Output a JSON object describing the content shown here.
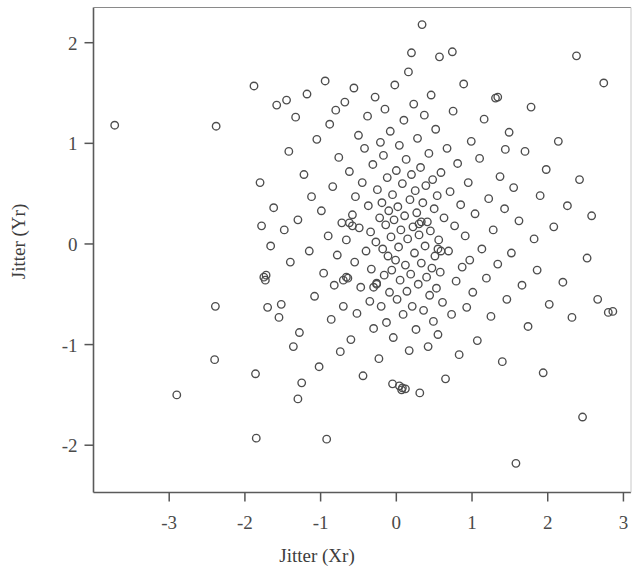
{
  "chart_data": {
    "type": "scatter",
    "title": "",
    "xlabel": "Jitter (Xr)",
    "ylabel": "Jitter (Yr)",
    "xlim": [
      -4.0,
      3.1
    ],
    "ylim": [
      -2.47,
      2.35
    ],
    "xticks": [
      -3,
      -2,
      -1,
      0,
      1,
      2,
      3
    ],
    "xtick_labels": [
      "-3",
      "-2",
      "-1",
      "0",
      "1",
      "2",
      "3"
    ],
    "yticks": [
      -2,
      -1,
      0,
      1,
      2
    ],
    "ytick_labels": [
      "-2",
      "-1",
      "0",
      "1",
      "2"
    ],
    "grid": false,
    "legend": null,
    "marker": "open-circle",
    "marker_size": 7.5,
    "marker_color": "#4d4d4d",
    "n_points": 249,
    "points": [
      [
        -3.72,
        1.18
      ],
      [
        -2.9,
        -1.5
      ],
      [
        -2.38,
        1.17
      ],
      [
        -2.39,
        -0.62
      ],
      [
        -2.4,
        -1.15
      ],
      [
        -1.88,
        1.57
      ],
      [
        -1.86,
        -1.29
      ],
      [
        -1.85,
        -1.93
      ],
      [
        -1.8,
        0.61
      ],
      [
        -1.78,
        0.18
      ],
      [
        -1.75,
        -0.33
      ],
      [
        -1.73,
        -0.36
      ],
      [
        -1.7,
        -0.63
      ],
      [
        -1.66,
        -0.02
      ],
      [
        -1.62,
        0.36
      ],
      [
        -1.58,
        1.38
      ],
      [
        -1.55,
        -0.73
      ],
      [
        -1.52,
        -0.6
      ],
      [
        -1.48,
        0.14
      ],
      [
        -1.45,
        1.43
      ],
      [
        -1.42,
        0.92
      ],
      [
        -1.4,
        -0.18
      ],
      [
        -1.36,
        -1.02
      ],
      [
        -1.33,
        1.26
      ],
      [
        -1.3,
        0.24
      ],
      [
        -1.28,
        -0.88
      ],
      [
        -1.25,
        -1.38
      ],
      [
        -1.22,
        0.69
      ],
      [
        -1.18,
        1.49
      ],
      [
        -1.15,
        -0.07
      ],
      [
        -1.12,
        0.47
      ],
      [
        -1.08,
        -0.52
      ],
      [
        -1.05,
        1.04
      ],
      [
        -1.02,
        -1.22
      ],
      [
        -0.99,
        0.33
      ],
      [
        -0.96,
        -0.29
      ],
      [
        -0.94,
        1.62
      ],
      [
        -0.92,
        -1.94
      ],
      [
        -0.9,
        0.08
      ],
      [
        -0.88,
        1.19
      ],
      [
        -0.86,
        -0.75
      ],
      [
        -0.84,
        0.57
      ],
      [
        -0.82,
        -0.41
      ],
      [
        -0.8,
        1.33
      ],
      [
        -0.78,
        -0.11
      ],
      [
        -0.76,
        0.86
      ],
      [
        -0.74,
        -1.07
      ],
      [
        -0.72,
        0.21
      ],
      [
        -0.7,
        -0.62
      ],
      [
        -0.68,
        1.41
      ],
      [
        -0.66,
        0.04
      ],
      [
        -0.64,
        -0.34
      ],
      [
        -0.62,
        0.72
      ],
      [
        -0.6,
        -0.95
      ],
      [
        -0.58,
        0.29
      ],
      [
        -0.56,
        1.55
      ],
      [
        -0.55,
        -0.18
      ],
      [
        -0.54,
        0.47
      ],
      [
        -0.52,
        -0.69
      ],
      [
        -0.5,
        1.08
      ],
      [
        -0.49,
        0.16
      ],
      [
        -0.47,
        -0.43
      ],
      [
        -0.45,
        0.61
      ],
      [
        -0.44,
        -1.31
      ],
      [
        -0.42,
        0.95
      ],
      [
        -0.4,
        -0.07
      ],
      [
        -0.38,
        1.27
      ],
      [
        -0.37,
        0.38
      ],
      [
        -0.35,
        -0.57
      ],
      [
        -0.34,
        0.12
      ],
      [
        -0.33,
        -0.25
      ],
      [
        -0.31,
        0.79
      ],
      [
        -0.3,
        -0.84
      ],
      [
        -0.28,
        1.46
      ],
      [
        -0.27,
        0.02
      ],
      [
        -0.26,
        -0.39
      ],
      [
        -0.25,
        0.54
      ],
      [
        -0.23,
        -1.14
      ],
      [
        -0.22,
        0.26
      ],
      [
        -0.21,
        1.01
      ],
      [
        -0.2,
        -0.62
      ],
      [
        -0.19,
        0.41
      ],
      [
        -0.18,
        -0.05
      ],
      [
        -0.17,
        0.88
      ],
      [
        -0.16,
        -0.31
      ],
      [
        -0.15,
        1.34
      ],
      [
        -0.14,
        0.19
      ],
      [
        -0.13,
        -0.78
      ],
      [
        -0.12,
        0.66
      ],
      [
        -0.11,
        -0.12
      ],
      [
        -0.1,
        0.33
      ],
      [
        -0.09,
        -0.48
      ],
      [
        -0.08,
        1.12
      ],
      [
        -0.07,
        0.07
      ],
      [
        -0.06,
        -0.26
      ],
      [
        -0.05,
        0.49
      ],
      [
        -0.04,
        -0.93
      ],
      [
        -0.03,
        0.24
      ],
      [
        -0.02,
        1.58
      ],
      [
        -0.01,
        -0.16
      ],
      [
        0.0,
        0.73
      ],
      [
        0.01,
        -0.55
      ],
      [
        0.02,
        0.37
      ],
      [
        0.03,
        -0.03
      ],
      [
        0.04,
        0.98
      ],
      [
        0.05,
        -0.36
      ],
      [
        0.06,
        0.14
      ],
      [
        0.07,
        -1.45
      ],
      [
        0.08,
        0.6
      ],
      [
        0.09,
        -0.7
      ],
      [
        0.1,
        1.23
      ],
      [
        0.11,
        0.28
      ],
      [
        0.12,
        -0.21
      ],
      [
        0.13,
        0.84
      ],
      [
        0.14,
        -0.47
      ],
      [
        0.15,
        0.05
      ],
      [
        0.16,
        1.71
      ],
      [
        0.17,
        -1.06
      ],
      [
        0.18,
        0.44
      ],
      [
        0.19,
        -0.3
      ],
      [
        0.2,
        0.69
      ],
      [
        0.21,
        -0.62
      ],
      [
        0.22,
        0.17
      ],
      [
        0.23,
        1.39
      ],
      [
        0.24,
        -0.09
      ],
      [
        0.25,
        0.53
      ],
      [
        0.26,
        -0.85
      ],
      [
        0.27,
        0.31
      ],
      [
        0.28,
        1.05
      ],
      [
        0.29,
        -0.4
      ],
      [
        0.3,
        0.09
      ],
      [
        0.31,
        -1.48
      ],
      [
        0.32,
        0.76
      ],
      [
        0.33,
        -0.19
      ],
      [
        0.34,
        2.18
      ],
      [
        0.35,
        0.41
      ],
      [
        0.36,
        -0.66
      ],
      [
        0.37,
        1.28
      ],
      [
        0.38,
        -0.02
      ],
      [
        0.39,
        0.58
      ],
      [
        0.4,
        -0.33
      ],
      [
        0.41,
        0.22
      ],
      [
        0.42,
        -1.02
      ],
      [
        0.43,
        0.9
      ],
      [
        0.44,
        -0.51
      ],
      [
        0.45,
        0.13
      ],
      [
        0.46,
        1.48
      ],
      [
        0.47,
        -0.24
      ],
      [
        0.48,
        0.64
      ],
      [
        0.49,
        -0.77
      ],
      [
        0.5,
        0.35
      ],
      [
        0.51,
        -0.12
      ],
      [
        0.52,
        1.14
      ],
      [
        0.53,
        -0.44
      ],
      [
        0.54,
        0.48
      ],
      [
        0.55,
        -0.9
      ],
      [
        0.56,
        0.04
      ],
      [
        0.57,
        1.86
      ],
      [
        0.58,
        -0.28
      ],
      [
        0.59,
        0.71
      ],
      [
        0.61,
        -0.58
      ],
      [
        0.63,
        0.26
      ],
      [
        0.65,
        -1.34
      ],
      [
        0.67,
        0.95
      ],
      [
        0.69,
        -0.07
      ],
      [
        0.71,
        0.52
      ],
      [
        0.73,
        -0.7
      ],
      [
        0.75,
        1.32
      ],
      [
        0.77,
        0.18
      ],
      [
        0.79,
        -0.37
      ],
      [
        0.81,
        0.8
      ],
      [
        0.83,
        -1.1
      ],
      [
        0.85,
        0.39
      ],
      [
        0.87,
        -0.23
      ],
      [
        0.89,
        1.59
      ],
      [
        0.91,
        0.08
      ],
      [
        0.93,
        -0.63
      ],
      [
        0.95,
        0.61
      ],
      [
        0.97,
        -0.16
      ],
      [
        0.99,
        1.02
      ],
      [
        1.01,
        -0.48
      ],
      [
        1.04,
        0.3
      ],
      [
        1.07,
        -0.96
      ],
      [
        1.1,
        0.85
      ],
      [
        1.13,
        -0.05
      ],
      [
        1.16,
        1.24
      ],
      [
        1.19,
        -0.34
      ],
      [
        1.22,
        0.45
      ],
      [
        1.25,
        -0.72
      ],
      [
        1.28,
        0.14
      ],
      [
        1.31,
        1.45
      ],
      [
        1.34,
        -0.2
      ],
      [
        1.37,
        0.67
      ],
      [
        1.4,
        -1.17
      ],
      [
        1.43,
        0.35
      ],
      [
        1.46,
        -0.55
      ],
      [
        1.49,
        1.11
      ],
      [
        1.52,
        -0.09
      ],
      [
        1.55,
        0.56
      ],
      [
        1.58,
        -2.18
      ],
      [
        1.62,
        0.23
      ],
      [
        1.66,
        -0.41
      ],
      [
        1.7,
        0.92
      ],
      [
        1.74,
        -0.82
      ],
      [
        1.78,
        1.36
      ],
      [
        1.82,
        0.05
      ],
      [
        1.86,
        -0.26
      ],
      [
        1.9,
        0.48
      ],
      [
        1.94,
        -1.28
      ],
      [
        1.98,
        0.74
      ],
      [
        2.02,
        -0.6
      ],
      [
        2.08,
        0.17
      ],
      [
        2.14,
        1.02
      ],
      [
        2.2,
        -0.38
      ],
      [
        2.26,
        0.38
      ],
      [
        2.32,
        -0.73
      ],
      [
        2.38,
        1.87
      ],
      [
        2.42,
        0.64
      ],
      [
        2.46,
        -1.72
      ],
      [
        2.52,
        -0.14
      ],
      [
        2.58,
        0.28
      ],
      [
        2.66,
        -0.55
      ],
      [
        2.74,
        1.6
      ],
      [
        2.8,
        -0.68
      ],
      [
        2.86,
        -0.67
      ],
      [
        -0.62,
        0.21
      ],
      [
        -0.58,
        0.18
      ],
      [
        0.3,
        0.2
      ],
      [
        0.33,
        0.22
      ],
      [
        -0.66,
        -0.33
      ],
      [
        -0.7,
        -0.36
      ],
      [
        -0.3,
        -0.43
      ],
      [
        -0.26,
        -0.4
      ],
      [
        0.55,
        -0.05
      ],
      [
        0.59,
        -0.07
      ],
      [
        -1.72,
        -0.31
      ],
      [
        0.04,
        -1.41
      ],
      [
        0.08,
        -1.43
      ],
      [
        0.12,
        -1.44
      ],
      [
        -0.05,
        -1.39
      ],
      [
        1.44,
        0.94
      ],
      [
        0.2,
        1.9
      ],
      [
        0.74,
        1.91
      ],
      [
        1.34,
        1.46
      ],
      [
        -1.3,
        -1.54
      ]
    ]
  },
  "axes": {
    "tick_color": "#555555",
    "axis_color": "#555555",
    "background": "#ffffff"
  }
}
